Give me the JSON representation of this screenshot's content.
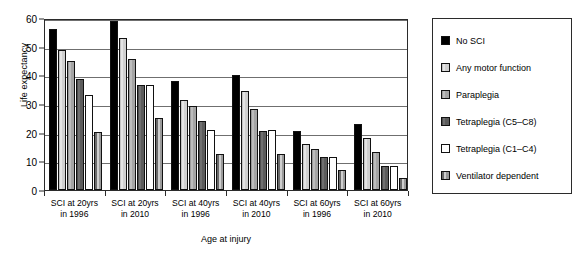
{
  "chart_data": {
    "type": "bar",
    "title": "",
    "xlabel": "Age at injury",
    "ylabel": "Life expectancy",
    "ylim": [
      0,
      60
    ],
    "yticks": [
      0,
      10,
      20,
      30,
      40,
      50,
      60
    ],
    "grid": true,
    "legend_position": "right",
    "categories": [
      "SCI at 20yrs in 1996",
      "SCI at 20yrs in 2010",
      "SCI at 40yrs in 1996",
      "SCI at 40yrs in 2010",
      "SCI at 60yrs in 1996",
      "SCI at 60yrs in 2010"
    ],
    "category_lines": [
      [
        "SCI at 20yrs",
        "in 1996"
      ],
      [
        "SCI at 20yrs",
        "in 2010"
      ],
      [
        "SCI at 40yrs",
        "in 1996"
      ],
      [
        "SCI at 40yrs",
        "in 2010"
      ],
      [
        "SCI at 60yrs",
        "in 1996"
      ],
      [
        "SCI at 60yrs",
        "in 2010"
      ]
    ],
    "series": [
      {
        "name": "No SCI",
        "fill": "black",
        "color": "#000000",
        "values": [
          56.0,
          59.0,
          38.0,
          40.0,
          20.5,
          23.0
        ]
      },
      {
        "name": "Any motor function",
        "fill": "lightgrey",
        "color": "#d2d2d2",
        "values": [
          49.0,
          53.0,
          31.5,
          34.5,
          16.2,
          18.3
        ]
      },
      {
        "name": "Paraplegia",
        "fill": "midgrey",
        "color": "#a8a8a8",
        "values": [
          45.0,
          45.6,
          29.2,
          28.1,
          14.3,
          13.1
        ]
      },
      {
        "name": "Tetraplegia (C5–C8)",
        "fill": "darkgrey",
        "color": "#5f5f5f",
        "values": [
          38.6,
          36.6,
          24.0,
          20.6,
          11.5,
          8.5
        ]
      },
      {
        "name": "Tetraplegia (C1–C4)",
        "fill": "white",
        "color": "#ffffff",
        "values": [
          33.0,
          36.6,
          21.0,
          20.8,
          11.6,
          8.4
        ]
      },
      {
        "name": "Ventilator dependent",
        "fill": "vent",
        "color": "#9d9d9d",
        "values": [
          20.1,
          25.1,
          12.7,
          12.5,
          7.0,
          4.1
        ]
      }
    ]
  },
  "legend": {
    "items": [
      {
        "label": "No SCI"
      },
      {
        "label": "Any motor function"
      },
      {
        "label": "Paraplegia"
      },
      {
        "label": "Tetraplegia (C5–C8)"
      },
      {
        "label": "Tetraplegia (C1–C4)"
      },
      {
        "label": "Ventilator dependent"
      }
    ]
  }
}
